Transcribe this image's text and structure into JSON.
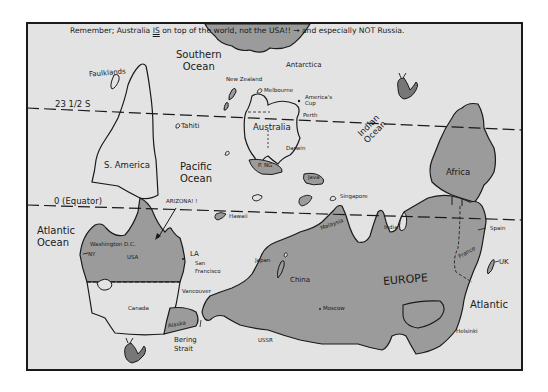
{
  "title": {
    "pre": "Remember; Australia ",
    "emph": "IS",
    "post": " on top of the world, not the USA!! → and especially NOT Russia."
  },
  "colors": {
    "sea": "#e3e3e3",
    "land_dark": "#9b9b9b",
    "land_light": "#e3e3e3",
    "outline": "#1a1a1a",
    "page": "#ffffff"
  },
  "lines": {
    "tropic": "23 1/2 S",
    "equator": "0  (Equator)"
  },
  "oceans": {
    "southern": [
      "Southern",
      "Ocean"
    ],
    "indian": [
      "Indian",
      "Ocean"
    ],
    "pacific": [
      "Pacific",
      "Ocean"
    ],
    "atlantic_west": [
      "Atlantic",
      "Ocean"
    ],
    "atlantic_east": "Atlantic"
  },
  "places": {
    "antarctica": "Antarctica",
    "falklands": "Faulklands",
    "new_zealand": "New Zealand",
    "melbourne": "Melbourne",
    "americas_cup": [
      "America's",
      "Cup"
    ],
    "perth": "Perth",
    "australia": "Australia",
    "darwin": "Darwin",
    "tahiti": "Tahiti",
    "png": "P. NG",
    "java": "Java",
    "s_america": "S. America",
    "africa": "Africa",
    "singapore": "Singapore",
    "hawaii": "Hawaii",
    "arizona": "ARIZONA! !",
    "washington": "Washington D.C.",
    "ny": "NY",
    "usa": "USA",
    "la": "LA",
    "san_francisco": [
      "San",
      "Francisco"
    ],
    "vancouver": "Vancouver",
    "canada": "Canada",
    "alaska": "Alaska",
    "bering": [
      "Bering",
      "Strait"
    ],
    "japan": "Japan",
    "china": "China",
    "malaysia": "Malaysia",
    "india": "India",
    "spain": "Spain",
    "france": "France",
    "uk": "UK",
    "europe": "EUROPE",
    "moscow": "Moscow",
    "ussr": "USSR",
    "helsinki": "Helsinki"
  }
}
